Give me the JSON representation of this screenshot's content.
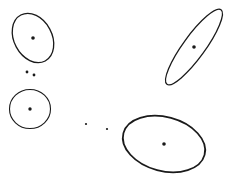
{
  "diagram": {
    "width": 233,
    "height": 182,
    "background": "#ffffff",
    "stroke_color": "#1a1a1a",
    "ellipses": [
      {
        "id": "ellipse-top-left",
        "cx": 33,
        "cy": 38,
        "rx": 19,
        "ry": 26,
        "rotate": -28,
        "stroke_width": 1.3,
        "center_r": 1.8
      },
      {
        "id": "circle-left",
        "cx": 30,
        "cy": 109,
        "rx": 20.5,
        "ry": 19.5,
        "rotate": 0,
        "stroke_width": 1.1,
        "center_r": 1.7
      },
      {
        "id": "ellipse-long-diagonal",
        "cx": 194,
        "cy": 47,
        "rx": 11,
        "ry": 46,
        "rotate": 36,
        "stroke_width": 1.3,
        "center_r": 1.8
      },
      {
        "id": "ellipse-bottom-right",
        "cx": 164,
        "cy": 144,
        "rx": 42,
        "ry": 27,
        "rotate": 15,
        "stroke_width": 1.8,
        "center_r": 1.8
      }
    ],
    "points": [
      {
        "x": 27,
        "y": 72,
        "r": 1.4
      },
      {
        "x": 34,
        "y": 75,
        "r": 1.4
      },
      {
        "x": 86,
        "y": 124,
        "r": 1.1
      },
      {
        "x": 107,
        "y": 129,
        "r": 1.1
      }
    ]
  }
}
